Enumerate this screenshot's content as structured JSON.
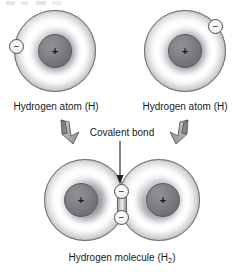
{
  "figure": {
    "title_visible": false,
    "background": "#ffffff"
  },
  "colors": {
    "nucleus": "#78797e",
    "shell_rim": "#95979b",
    "shell_highlight": "#ffffff",
    "electron_fill": "#f4f4f5",
    "outline": "#6e7075",
    "arrow_fill": "#a8aaae",
    "text": "#1a1b1d"
  },
  "atoms": [
    {
      "id": "left-atom",
      "nucleus_symbol": "+",
      "electron_symbol": "−",
      "caption": "Hydrogen atom (H)",
      "electron_position": "left"
    },
    {
      "id": "right-atom",
      "nucleus_symbol": "+",
      "electron_symbol": "−",
      "caption": "Hydrogen atom (H)",
      "electron_position": "upper-right"
    }
  ],
  "bond": {
    "label": "Covalent bond",
    "shared_electron_symbol": "−",
    "shared_electron_count": 2
  },
  "molecule": {
    "caption_text": "Hydrogen molecule (H",
    "caption_subscript": "2",
    "caption_suffix": ")",
    "left_nucleus_symbol": "+",
    "right_nucleus_symbol": "+",
    "top_electron_symbol": "−",
    "bottom_electron_symbol": "−"
  },
  "icons": {
    "block_arrow_left": "block-arrow-down-right",
    "block_arrow_right": "block-arrow-down-left",
    "pointer_arrow": "arrow-down"
  }
}
